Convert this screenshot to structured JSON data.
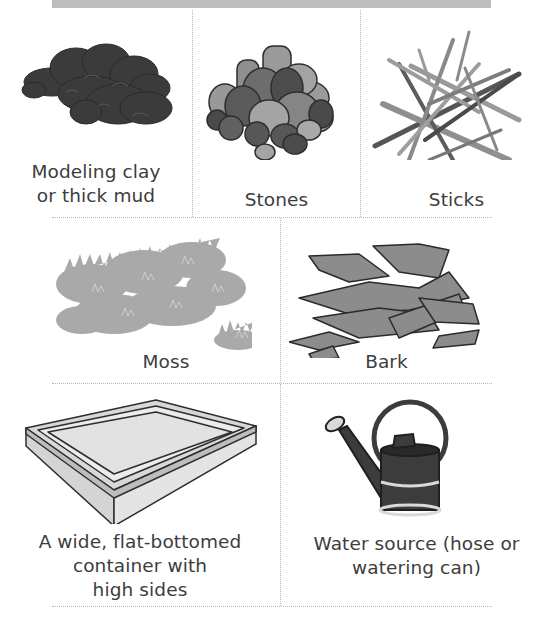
{
  "page": {
    "header_bar_color": "#bdbdbd",
    "divider_color": "#b8b8b8"
  },
  "materials": [
    {
      "id": "clay",
      "label": "Modeling clay\nor thick mud",
      "label_lines": [
        "Modeling clay",
        "or thick mud"
      ],
      "icon": "clay-icon",
      "color": "#3b3b3b"
    },
    {
      "id": "stones",
      "label": "Stones",
      "label_lines": [
        "Stones"
      ],
      "icon": "stones-icon",
      "color": "#7a7a7a"
    },
    {
      "id": "sticks",
      "label": "Sticks",
      "label_lines": [
        "Sticks"
      ],
      "icon": "sticks-icon",
      "color": "#8a8a8a"
    },
    {
      "id": "moss",
      "label": "Moss",
      "label_lines": [
        "Moss"
      ],
      "icon": "moss-icon",
      "color": "#a9a9a9"
    },
    {
      "id": "bark",
      "label": "Bark",
      "label_lines": [
        "Bark"
      ],
      "icon": "bark-icon",
      "color": "#8c8c8c"
    },
    {
      "id": "container",
      "label": "A wide, flat-bottomed container with high sides",
      "label_lines": [
        "A wide, flat-bottomed",
        "container with",
        "high sides"
      ],
      "icon": "container-icon",
      "color": "#cfcfcf"
    },
    {
      "id": "water",
      "label": "Water source (hose or watering can)",
      "label_lines": [
        "Water source (hose or",
        "watering can)"
      ],
      "icon": "watering-can-icon",
      "color": "#3c3c3c"
    }
  ]
}
